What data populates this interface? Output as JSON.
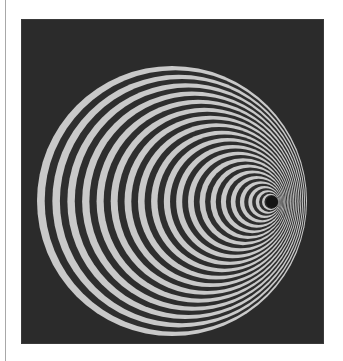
{
  "figure": {
    "colors": {
      "background": "#ffffff",
      "frame": "#2b2b2b",
      "ring_light": "#c9c9c9",
      "ring_dark": "#2e2e2e",
      "hole": "#141414",
      "rule": "#a8a8a8"
    },
    "outer_circle": {
      "cx": 172,
      "cy": 201,
      "r": 135
    },
    "vanishing_point": {
      "cx": 272,
      "cy": 202,
      "r": 6
    },
    "ring_pairs": 20
  }
}
